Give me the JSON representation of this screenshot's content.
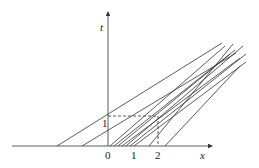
{
  "diagram": {
    "axes": {
      "x_label": "x",
      "y_label": "t"
    },
    "x_ticks": [
      "0",
      "1",
      "2"
    ],
    "y_ticks": [
      "1"
    ],
    "focus_point": {
      "x": "2",
      "t": "1"
    }
  }
}
